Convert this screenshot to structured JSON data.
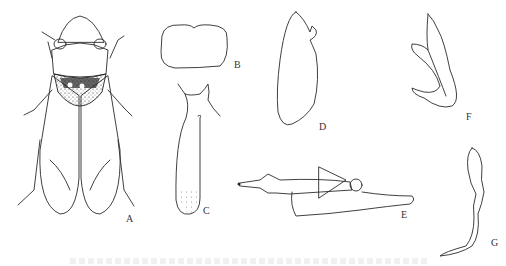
{
  "figure": {
    "panels": [
      {
        "id": "A",
        "label": "A",
        "description": "habitus, dorsal view (stippled leafhopper)"
      },
      {
        "id": "B",
        "label": "B",
        "description": "pygofer outline"
      },
      {
        "id": "C",
        "label": "C",
        "description": "subgenital plate with stippling"
      },
      {
        "id": "D",
        "label": "D",
        "description": "lobe outline"
      },
      {
        "id": "E",
        "label": "E",
        "description": "aedeagus, lateral view"
      },
      {
        "id": "F",
        "label": "F",
        "description": "style"
      },
      {
        "id": "G",
        "label": "G",
        "description": "connective / process"
      }
    ]
  }
}
